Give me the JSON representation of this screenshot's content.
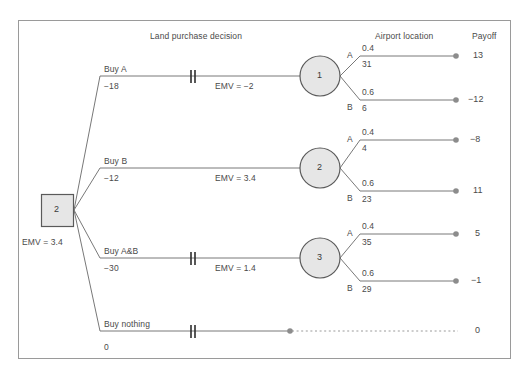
{
  "figure": {
    "headers": {
      "decision_stage": "Land purchase decision",
      "chance_stage": "Airport location",
      "payoff": "Payoff"
    },
    "root": {
      "type": "decision-node",
      "value": "2",
      "emv_label": "EMV = 3.4"
    },
    "branches": [
      {
        "id": "buy-a",
        "label": "Buy A",
        "cost": "−18",
        "emv_label": "EMV = −2",
        "pruned": true,
        "chance_node": "1",
        "outcomes": [
          {
            "name": "A",
            "prob": "0.4",
            "value": "31",
            "payoff": "13"
          },
          {
            "name": "B",
            "prob": "0.6",
            "value": "6",
            "payoff": "−12"
          }
        ]
      },
      {
        "id": "buy-b",
        "label": "Buy B",
        "cost": "−12",
        "emv_label": "EMV = 3.4",
        "pruned": false,
        "chance_node": "2",
        "outcomes": [
          {
            "name": "A",
            "prob": "0.4",
            "value": "4",
            "payoff": "−8"
          },
          {
            "name": "B",
            "prob": "0.6",
            "value": "23",
            "payoff": "11"
          }
        ]
      },
      {
        "id": "buy-a-and-b",
        "label": "Buy A&B",
        "cost": "−30",
        "emv_label": "EMV = 1.4",
        "pruned": true,
        "chance_node": "3",
        "outcomes": [
          {
            "name": "A",
            "prob": "0.4",
            "value": "35",
            "payoff": "5"
          },
          {
            "name": "B",
            "prob": "0.6",
            "value": "29",
            "payoff": "−1"
          }
        ]
      },
      {
        "id": "buy-nothing",
        "label": "Buy nothing",
        "cost": "0",
        "emv_label": "",
        "pruned": true,
        "chance_node": "",
        "outcomes": [],
        "payoff": "0"
      }
    ],
    "colors": {
      "node_fill": "#e6e6e6",
      "node_stroke": "#5a5a5a",
      "line": "#787878",
      "border": "#9a9a9a",
      "terminal_dot": "#8c8c8c"
    }
  }
}
